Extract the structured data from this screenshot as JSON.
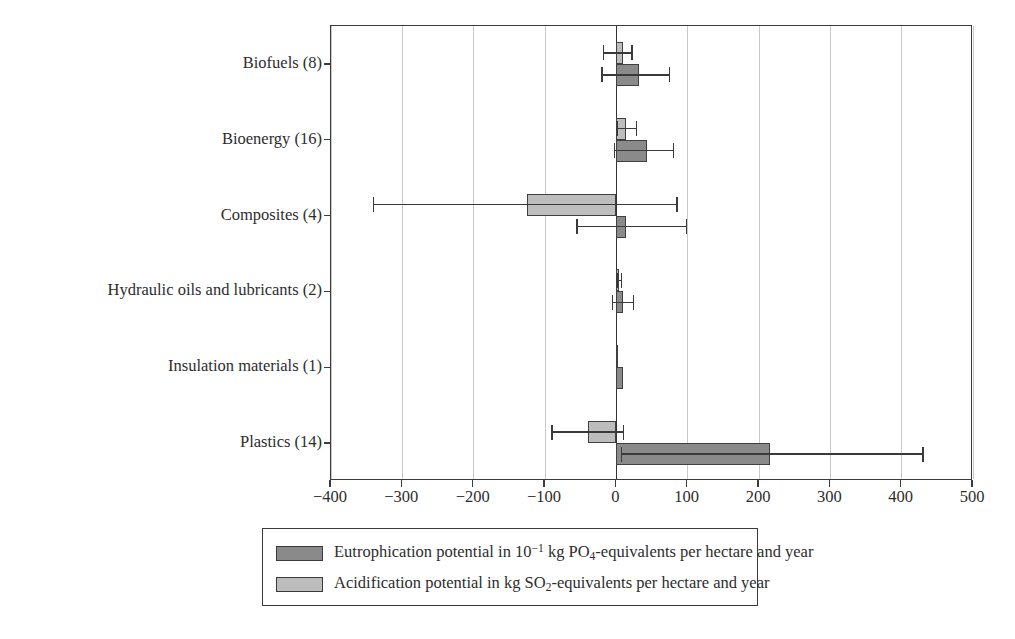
{
  "chart_data": {
    "type": "bar",
    "orientation": "horizontal",
    "title": "",
    "xlabel": "",
    "ylabel": "",
    "xlim": [
      -400,
      500
    ],
    "xticks": [
      -400,
      -300,
      -200,
      -100,
      0,
      100,
      200,
      300,
      400,
      500
    ],
    "xtick_labels": [
      "−400",
      "−300",
      "−200",
      "−100",
      "0",
      "100",
      "200",
      "300",
      "400",
      "500"
    ],
    "grid": "vertical",
    "legend_position": "below-plot",
    "categories": [
      "Biofuels (8)",
      "Bioenergy (16)",
      "Composites (4)",
      "Hydraulic oils and lubricants (2)",
      "Insulation materials (1)",
      "Plastics (14)"
    ],
    "series": [
      {
        "name": "Eutrophication potential in 10−1 kg PO4-equivalents per hectare and year",
        "short_name": "eutrophication",
        "color": "#8a8a8a",
        "values": [
          32,
          43,
          14,
          9,
          9,
          215
        ],
        "err_low": [
          -20,
          -3,
          -55,
          -5,
          null,
          7
        ],
        "err_high": [
          75,
          80,
          98,
          24,
          null,
          430
        ]
      },
      {
        "name": "Acidification potential in kg SO2-equivalents per hectare and year",
        "short_name": "acidification",
        "color": "#bdbdbd",
        "values": [
          10,
          13,
          -125,
          4,
          3,
          -40
        ],
        "err_low": [
          -18,
          1,
          -340,
          1,
          null,
          -90
        ],
        "err_high": [
          22,
          28,
          85,
          7,
          null,
          10
        ]
      }
    ]
  },
  "legend": {
    "items": [
      {
        "swatch": "dark",
        "prefix": "Eutrophication potential in 10",
        "sup": "−1",
        "mid": " kg PO",
        "sub": "4",
        "suffix": "-equivalents per hectare and year"
      },
      {
        "swatch": "light",
        "prefix": "Acidification potential in kg SO",
        "sup": "",
        "mid": "",
        "sub": "2",
        "suffix": "-equivalents per hectare and year"
      }
    ]
  }
}
